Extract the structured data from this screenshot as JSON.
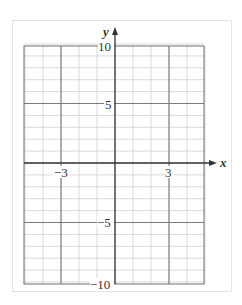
{
  "chart_data": {
    "type": "line",
    "title": "",
    "xlabel": "x",
    "ylabel": "y",
    "xlim": [
      -5,
      5
    ],
    "ylim": [
      -10,
      10
    ],
    "grid": true,
    "minor_grid_step": {
      "x": 1,
      "y": 1
    },
    "major_grid_lines": {
      "x": [
        -3,
        3
      ],
      "y": [
        -5,
        5
      ]
    },
    "x_tick_labels": [
      "-3",
      "3"
    ],
    "y_tick_labels": [
      "10",
      "5",
      "-5",
      "-10"
    ],
    "series": [],
    "legend": null
  },
  "labels": {
    "x_axis": "x",
    "y_axis": "y",
    "x_neg3": "−3",
    "x_pos3": "3",
    "y_10": "10",
    "y_5": "5",
    "y_neg5": "−5",
    "y_neg10": "−10"
  },
  "colors": {
    "minor_grid": "#cfcfcf",
    "major_grid": "#7a7a7a",
    "axis": "#333333",
    "frame": "#e4e4e4"
  }
}
